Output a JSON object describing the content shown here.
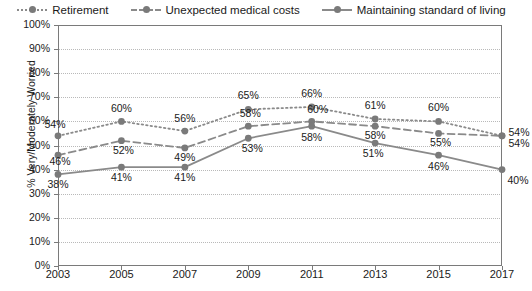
{
  "chart_data": {
    "type": "line",
    "title": "",
    "xlabel": "",
    "ylabel": "% Very/Moderately Worried",
    "categories": [
      "2003",
      "2005",
      "2007",
      "2009",
      "2011",
      "2013",
      "2015",
      "2017"
    ],
    "ylim": [
      0,
      100
    ],
    "ytick_labels": [
      "100%",
      "90%",
      "80%",
      "70%",
      "60%",
      "50%",
      "40%",
      "30%",
      "20%",
      "10%",
      "0%"
    ],
    "ytick_values": [
      100,
      90,
      80,
      70,
      60,
      50,
      40,
      30,
      20,
      10,
      0
    ],
    "grid": true,
    "legend_position": "top",
    "series": [
      {
        "name": "Retirement",
        "line_style": "dotted",
        "color": "#8a8a8a",
        "values": [
          54,
          60,
          56,
          65,
          66,
          61,
          60,
          54
        ],
        "labels": [
          "54%",
          "60%",
          "56%",
          "65%",
          "66%",
          "61%",
          "60%",
          "54%"
        ]
      },
      {
        "name": "Unexpected medical costs",
        "line_style": "dashed",
        "color": "#8a8a8a",
        "values": [
          46,
          52,
          49,
          58,
          60,
          58,
          55,
          54
        ],
        "labels": [
          "46%",
          "52%",
          "49%",
          "58%",
          "60%",
          "58%",
          "55%",
          "54%"
        ]
      },
      {
        "name": "Maintaining standard of living",
        "line_style": "solid",
        "color": "#8a8a8a",
        "values": [
          38,
          41,
          41,
          53,
          58,
          51,
          46,
          40
        ],
        "labels": [
          "38%",
          "41%",
          "41%",
          "53%",
          "58%",
          "51%",
          "46%",
          "40%"
        ]
      }
    ]
  },
  "legend": {
    "items": [
      {
        "label": "Retirement",
        "style": "dotted"
      },
      {
        "label": "Unexpected medical costs",
        "style": "dashed"
      },
      {
        "label": "Maintaining standard of living",
        "style": "solid"
      }
    ]
  },
  "caption": ""
}
